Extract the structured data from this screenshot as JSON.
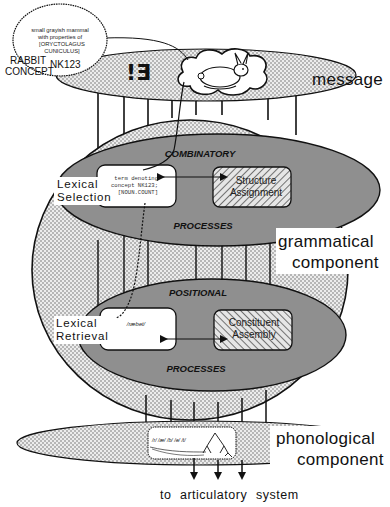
{
  "diagram": {
    "concept_bubble": {
      "definition_lines": [
        "small grayish mammal",
        "with properties of",
        "[ORYCTOLAGUS",
        "CUNICULUS]"
      ],
      "concept_id": "NK123",
      "label_line1": "RABBIT",
      "label_line2": "CONCEPT"
    },
    "message": {
      "label": "message",
      "quantifier_glyph": "!Ǝ",
      "icon": "rabbit-icon"
    },
    "grammatical": {
      "label_line1": "grammatical",
      "label_line2": "component",
      "combinatory": {
        "title": "COMBINATORY",
        "footer": "PROCESSES",
        "lexical_box_lines": [
          "term denoting",
          "concept NK123;",
          "[NOUN.COUNT]"
        ],
        "structure_box_line1": "Structure",
        "structure_box_line2": "Assignment"
      },
      "positional": {
        "title": "POSITIONAL",
        "footer": "PROCESSES",
        "lexical_box_text": "/ræbət/",
        "constituent_box_line1": "Constituent",
        "constituent_box_line2": "Assembly"
      }
    },
    "side_labels": {
      "lexical_selection_line1": "Lexical",
      "lexical_selection_line2": "Selection",
      "lexical_retrieval_line1": "Lexical",
      "lexical_retrieval_line2": "Retrieval"
    },
    "phonological": {
      "label_line1": "phonological",
      "label_line2": "component",
      "segments_text": "/r/ /æ/ /b/ /ə/ /t/",
      "icon": "syllable-tree-icon"
    },
    "output": {
      "word1": "to",
      "word2": "articulatory",
      "word3": "system"
    }
  },
  "colors": {
    "ink": "#111111",
    "dotted_fill": "#d4d4d4",
    "process_fill": "#8f8f8f",
    "box_fill": "#ffffff"
  }
}
